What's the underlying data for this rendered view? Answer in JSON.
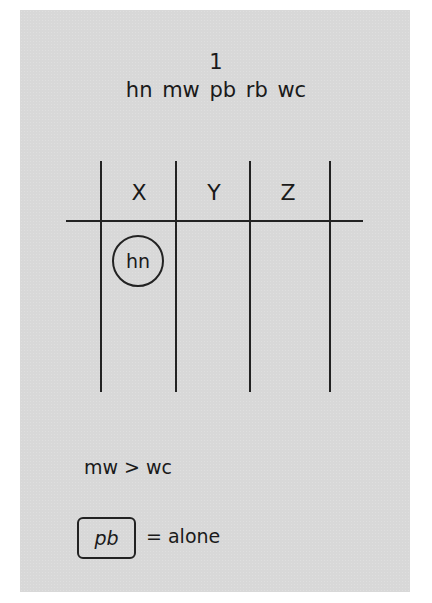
{
  "puzzle": {
    "number": "1",
    "entities_line": "hn mw pb rb wc",
    "entities": [
      "hn",
      "mw",
      "pb",
      "rb",
      "wc"
    ]
  },
  "grid": {
    "columns": [
      {
        "label": "X"
      },
      {
        "label": "Y"
      },
      {
        "label": "Z"
      }
    ],
    "placed": [
      {
        "entity": "hn",
        "column": "X",
        "marker": "circle"
      }
    ]
  },
  "rules": [
    {
      "text": "mw > wc"
    },
    {
      "boxed": "pb",
      "text": "= alone"
    }
  ],
  "colors": {
    "panel_background": "#d8d8d8",
    "ink": "#1a1a1a",
    "page_background": "#ffffff"
  }
}
